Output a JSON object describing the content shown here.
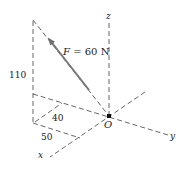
{
  "diagram": {
    "type": "3d-force-vector",
    "axes": {
      "x_label": "x",
      "y_label": "y",
      "z_label": "z",
      "origin_label": "O"
    },
    "force": {
      "label": "F = 60 N",
      "symbol": "F",
      "magnitude": "60",
      "unit": "N",
      "color": "#777777"
    },
    "dimensions": {
      "height": "110",
      "depth_a": "40",
      "depth_b": "50"
    },
    "line_color": "#555555"
  }
}
